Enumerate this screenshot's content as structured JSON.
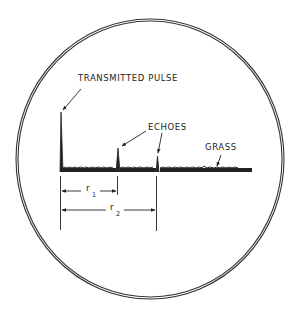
{
  "diagram": {
    "type": "radar A-scope display",
    "labels": {
      "transmitted_pulse": "TRANSMITTED PULSE",
      "echoes": "ECHOES",
      "grass": "GRASS",
      "r1": "r",
      "r1_sub": "1",
      "r2": "r",
      "r2_sub": "2"
    },
    "colors": {
      "ink": "#222222",
      "background": "#ffffff"
    }
  }
}
